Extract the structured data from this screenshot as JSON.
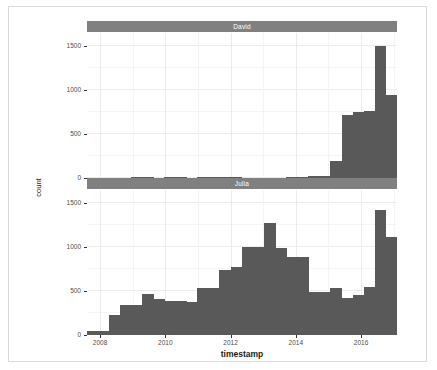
{
  "chart_data": {
    "type": "bar",
    "title": "",
    "xlabel": "timestamp",
    "ylabel": "count",
    "facet_variable": "author",
    "xlim": [
      2007.6,
      2017.1
    ],
    "ylim": [
      0,
      1650
    ],
    "grid": true,
    "legend": "none",
    "bar_color": "#595959",
    "strip_color": "#808080",
    "panel_bg": "#ffffff",
    "grid_color": "#ebebeb",
    "x_ticks": [
      "2008",
      "2010",
      "2012",
      "2014",
      "2016"
    ],
    "x_tick_values": [
      2008,
      2010,
      2012,
      2014,
      2016
    ],
    "y_ticks": [
      "0",
      "500",
      "1000",
      "1500"
    ],
    "y_tick_values": [
      0,
      500,
      1000,
      1500
    ],
    "bin_width": 0.34,
    "panels": [
      {
        "label": "David",
        "x": [
          2007.75,
          2008.09,
          2008.43,
          2008.77,
          2009.11,
          2009.45,
          2009.79,
          2010.13,
          2010.47,
          2010.81,
          2011.15,
          2011.49,
          2011.83,
          2012.17,
          2012.51,
          2012.85,
          2013.19,
          2013.53,
          2013.87,
          2014.21,
          2014.55,
          2014.89,
          2015.23,
          2015.57,
          2015.91,
          2016.25,
          2016.59,
          2016.93
        ],
        "values": [
          0,
          0,
          0,
          0,
          5,
          3,
          0,
          4,
          2,
          0,
          8,
          6,
          3,
          2,
          0,
          0,
          0,
          0,
          10,
          12,
          18,
          22,
          190,
          720,
          750,
          760,
          1500,
          940
        ]
      },
      {
        "label": "Julia",
        "x": [
          2007.75,
          2008.09,
          2008.43,
          2008.77,
          2009.11,
          2009.45,
          2009.79,
          2010.13,
          2010.47,
          2010.81,
          2011.15,
          2011.49,
          2011.83,
          2012.17,
          2012.51,
          2012.85,
          2013.19,
          2013.53,
          2013.87,
          2014.21,
          2014.55,
          2014.89,
          2015.23,
          2015.57,
          2015.91,
          2016.25,
          2016.59,
          2016.93
        ],
        "values": [
          50,
          50,
          230,
          340,
          340,
          465,
          415,
          390,
          390,
          375,
          535,
          535,
          745,
          775,
          1000,
          1000,
          1280,
          990,
          890,
          890,
          495,
          495,
          540,
          420,
          460,
          550,
          1420,
          1120
        ]
      }
    ]
  }
}
